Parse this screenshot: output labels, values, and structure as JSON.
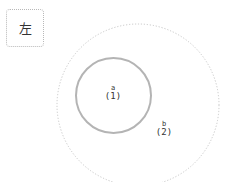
{
  "legend": {
    "label": "左"
  },
  "diagram": {
    "type": "nested-circles",
    "nodes": [
      {
        "id": "b",
        "name": "b",
        "count": "(2)",
        "cx": 138,
        "cy": 105,
        "r": 81,
        "stroke": "#c8c8c8",
        "style": "dotted"
      },
      {
        "id": "a",
        "name": "a",
        "count": "(1)",
        "cx": 113.5,
        "cy": 95.5,
        "r": 37.5,
        "stroke": "#b4b4b4",
        "style": "solid"
      }
    ]
  },
  "colors": {
    "outer_stroke": "#c8c8c8",
    "inner_stroke": "#b4b4b4",
    "text": "#333333",
    "background": "#ffffff"
  }
}
